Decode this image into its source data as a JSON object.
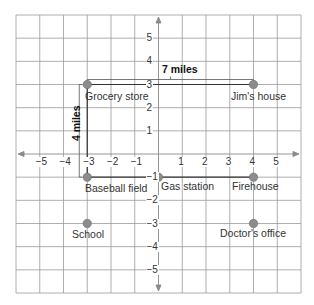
{
  "diagram": {
    "type": "coordinate-grid-map",
    "x_range": [
      -6,
      6
    ],
    "y_range": [
      -6,
      6
    ],
    "x_ticks": [
      "−5",
      "−4",
      "−3",
      "−2",
      "−1",
      "1",
      "2",
      "3",
      "4",
      "5"
    ],
    "y_ticks": [
      "5",
      "4",
      "3",
      "2",
      "1",
      "−1",
      "−2",
      "−3",
      "−4",
      "−5"
    ],
    "colors": {
      "grid": "#9a9a9a",
      "axis": "#8a8a8a",
      "point": "#8c8c8c",
      "path": "#333333"
    },
    "locations": [
      {
        "name": "Grocery store",
        "x": -3,
        "y": 3
      },
      {
        "name": "Jim's house",
        "x": 4,
        "y": 3
      },
      {
        "name": "Baseball field",
        "x": -3,
        "y": -1
      },
      {
        "name": "Gas station",
        "x": 0,
        "y": -1
      },
      {
        "name": "Firehouse",
        "x": 4,
        "y": -1
      },
      {
        "name": "School",
        "x": -3,
        "y": -3
      },
      {
        "name": "Doctor's office",
        "x": 4,
        "y": -3
      }
    ],
    "distance_labels": {
      "horizontal": "7 miles",
      "vertical": "4 miles"
    }
  }
}
